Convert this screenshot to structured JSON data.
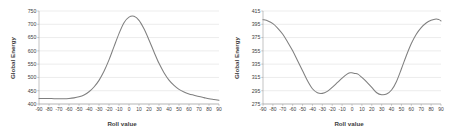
{
  "figure": {
    "panels": [
      "left",
      "right"
    ],
    "line_color": "#7f7f7f",
    "grid_color": "#d9d9d9",
    "axis_color": "#9a9a9a",
    "background": "#ffffff"
  },
  "chart_data": [
    {
      "id": "left",
      "type": "line",
      "title": "",
      "xlabel": "Roll value",
      "ylabel": "Global Energy",
      "xlim": [
        -90,
        90
      ],
      "ylim": [
        400,
        750
      ],
      "xticks": [
        -90,
        -80,
        -70,
        -60,
        -50,
        -40,
        -30,
        -20,
        -10,
        0,
        10,
        20,
        30,
        40,
        50,
        60,
        70,
        80,
        90
      ],
      "yticks": [
        400,
        450,
        500,
        550,
        600,
        650,
        700,
        750
      ],
      "grid": "horizontal",
      "legend": "none",
      "x": [
        -90,
        -85,
        -80,
        -75,
        -70,
        -65,
        -60,
        -55,
        -50,
        -45,
        -40,
        -35,
        -30,
        -25,
        -20,
        -15,
        -10,
        -5,
        0,
        5,
        10,
        15,
        20,
        25,
        30,
        35,
        40,
        45,
        50,
        55,
        60,
        65,
        70,
        75,
        80,
        85,
        90
      ],
      "values": [
        421,
        421,
        421,
        420,
        420,
        420,
        421,
        423,
        427,
        434,
        446,
        464,
        489,
        523,
        566,
        616,
        665,
        706,
        727,
        730,
        715,
        683,
        641,
        596,
        553,
        518,
        490,
        470,
        455,
        445,
        438,
        433,
        428,
        424,
        420,
        417,
        414
      ]
    },
    {
      "id": "right",
      "type": "line",
      "title": "",
      "xlabel": "Roll value",
      "ylabel": "Global Energy",
      "xlim": [
        -90,
        90
      ],
      "ylim": [
        275,
        415
      ],
      "xticks": [
        -90,
        -80,
        -70,
        -60,
        -50,
        -40,
        -30,
        -20,
        -10,
        0,
        10,
        20,
        30,
        40,
        50,
        60,
        70,
        80,
        90
      ],
      "yticks": [
        275,
        295,
        315,
        335,
        355,
        375,
        395,
        415
      ],
      "grid": "horizontal",
      "legend": "none",
      "x": [
        -90,
        -85,
        -80,
        -75,
        -70,
        -65,
        -60,
        -55,
        -50,
        -45,
        -40,
        -35,
        -30,
        -25,
        -20,
        -15,
        -10,
        -5,
        -2,
        0,
        3,
        6,
        10,
        15,
        20,
        25,
        30,
        35,
        40,
        45,
        50,
        55,
        60,
        65,
        70,
        75,
        80,
        85,
        88,
        90
      ],
      "values": [
        402,
        400,
        396,
        389,
        380,
        368,
        355,
        340,
        325,
        310,
        298,
        292,
        291,
        294,
        300,
        307,
        314,
        320,
        322,
        322,
        321,
        320,
        315,
        308,
        300,
        292,
        289,
        290,
        296,
        309,
        328,
        348,
        366,
        380,
        390,
        397,
        401,
        403,
        402,
        400
      ]
    }
  ]
}
